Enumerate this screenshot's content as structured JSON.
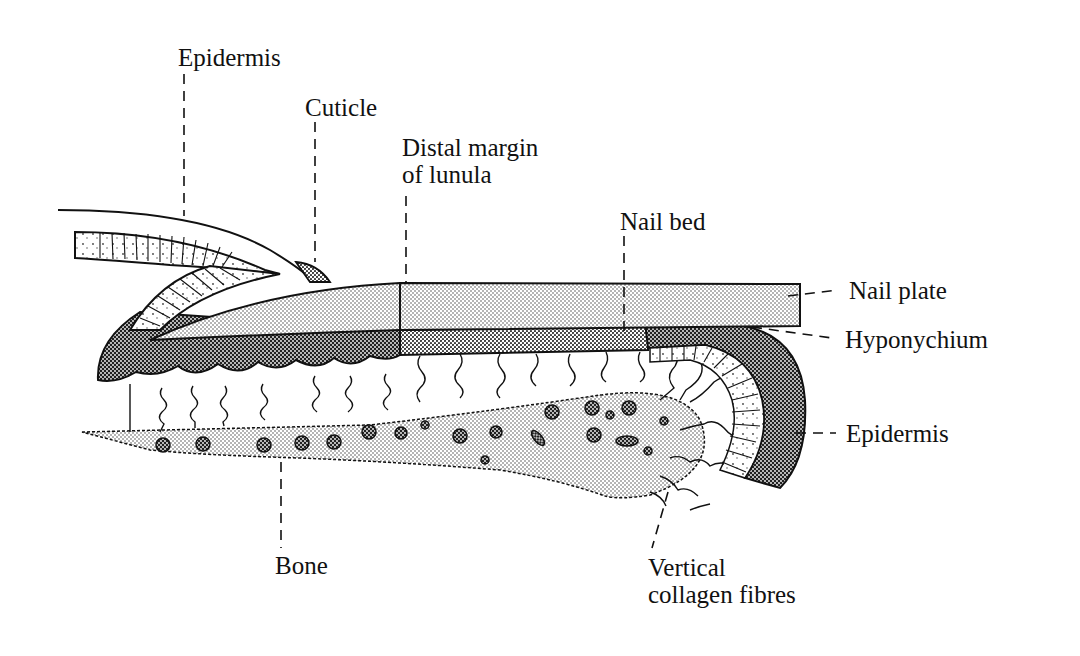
{
  "diagram": {
    "labels": {
      "epidermis_top": "Epidermis",
      "cuticle": "Cuticle",
      "distal_margin_line1": "Distal margin",
      "distal_margin_line2": "of lunula",
      "nail_bed": "Nail bed",
      "nail_plate": "Nail plate",
      "hyponychium": "Hyponychium",
      "epidermis_right": "Epidermis",
      "bone": "Bone",
      "collagen_line1": "Vertical",
      "collagen_line2": "collagen fibres"
    },
    "colors": {
      "ink": "#111111",
      "background": "#ffffff",
      "light_stipple": "#d9d9d9",
      "dark_stipple": "#6e6e6e",
      "medium_stipple": "#b5b5b5"
    }
  }
}
